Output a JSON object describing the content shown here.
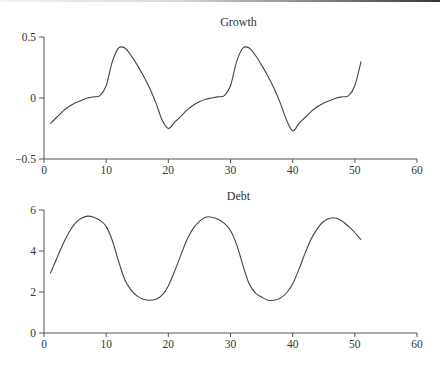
{
  "chart_data": [
    {
      "type": "line",
      "title": "Growth",
      "xlabel": "",
      "ylabel": "",
      "xlim": [
        0,
        60
      ],
      "ylim": [
        -0.5,
        0.5
      ],
      "xticks": [
        0,
        10,
        20,
        30,
        40,
        50,
        60
      ],
      "yticks": [
        -0.5,
        0,
        0.5
      ],
      "ytick_labels": [
        "−0.5",
        "0",
        "0.5"
      ],
      "grid": false,
      "legend": null,
      "x": [
        1,
        2,
        3,
        4,
        5,
        6,
        7,
        8,
        9,
        10,
        11,
        12,
        13,
        14,
        15,
        16,
        17,
        18,
        19,
        20,
        21,
        22,
        23,
        24,
        25,
        26,
        27,
        28,
        29,
        30,
        31,
        32,
        33,
        34,
        35,
        36,
        37,
        38,
        39,
        40,
        41,
        42,
        43,
        44,
        45,
        46,
        47,
        48,
        49,
        50,
        51
      ],
      "series": [
        {
          "name": "Growth",
          "values": [
            -0.21,
            -0.16,
            -0.11,
            -0.07,
            -0.04,
            -0.02,
            0.0,
            0.01,
            0.02,
            0.1,
            0.3,
            0.41,
            0.41,
            0.35,
            0.27,
            0.18,
            0.08,
            -0.04,
            -0.18,
            -0.25,
            -0.2,
            -0.15,
            -0.1,
            -0.06,
            -0.03,
            -0.01,
            0.0,
            0.01,
            0.02,
            0.1,
            0.3,
            0.41,
            0.41,
            0.35,
            0.27,
            0.18,
            0.08,
            -0.04,
            -0.18,
            -0.27,
            -0.21,
            -0.16,
            -0.11,
            -0.07,
            -0.04,
            -0.02,
            0.0,
            0.01,
            0.02,
            0.1,
            0.3
          ]
        }
      ]
    },
    {
      "type": "line",
      "title": "Debt",
      "xlabel": "",
      "ylabel": "",
      "xlim": [
        0,
        60
      ],
      "ylim": [
        0,
        6
      ],
      "xticks": [
        0,
        10,
        20,
        30,
        40,
        50,
        60
      ],
      "yticks": [
        0,
        2,
        4,
        6
      ],
      "ytick_labels": [
        "0",
        "2",
        "4",
        "6"
      ],
      "grid": false,
      "legend": null,
      "x": [
        1,
        2,
        3,
        4,
        5,
        6,
        7,
        8,
        9,
        10,
        11,
        12,
        13,
        14,
        15,
        16,
        17,
        18,
        19,
        20,
        21,
        22,
        23,
        24,
        25,
        26,
        27,
        28,
        29,
        30,
        31,
        32,
        33,
        34,
        35,
        36,
        37,
        38,
        39,
        40,
        41,
        42,
        43,
        44,
        45,
        46,
        47,
        48,
        49,
        50,
        51
      ],
      "series": [
        {
          "name": "Debt",
          "values": [
            2.9,
            3.6,
            4.3,
            4.9,
            5.35,
            5.6,
            5.7,
            5.65,
            5.5,
            5.2,
            4.5,
            3.5,
            2.6,
            2.1,
            1.8,
            1.65,
            1.6,
            1.65,
            1.85,
            2.3,
            3.0,
            3.8,
            4.55,
            5.1,
            5.45,
            5.65,
            5.65,
            5.55,
            5.35,
            5.0,
            4.3,
            3.3,
            2.4,
            1.95,
            1.75,
            1.6,
            1.6,
            1.7,
            1.95,
            2.4,
            3.1,
            3.9,
            4.6,
            5.1,
            5.45,
            5.6,
            5.6,
            5.45,
            5.2,
            4.9,
            4.55
          ]
        }
      ]
    }
  ]
}
